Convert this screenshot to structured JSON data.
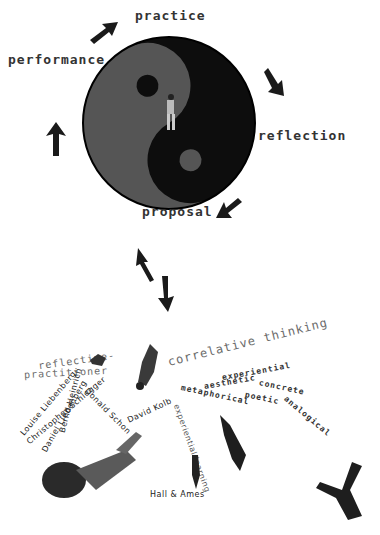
{
  "cycle": {
    "practice": "practice",
    "reflection": "reflection",
    "proposal": "proposal",
    "performance": "performance"
  },
  "colors": {
    "yin": "#555555",
    "yang": "#0d0d0d",
    "text": "#333333",
    "gray_text": "#6a6a6a"
  },
  "lower": {
    "reflective": "reflective-",
    "practitioner": "practitioner",
    "correlative": "correlative thinking",
    "experiential": "experiential",
    "concrete": "concrete",
    "aesthetic": "aesthetic",
    "metaphorical": "metaphorical",
    "poetic": "poetic",
    "analogical": "analogical",
    "names": {
      "louise": "Louise Liebenberg",
      "christopher": "Christopher Schlegger",
      "daniel": "Daniel Liebenberg",
      "bernd": "Bernd Heinrich",
      "donald": "Donald Schon",
      "david": "David Kolb",
      "exp_learning": "experiential learning",
      "hall": "Hall & Ames"
    }
  }
}
